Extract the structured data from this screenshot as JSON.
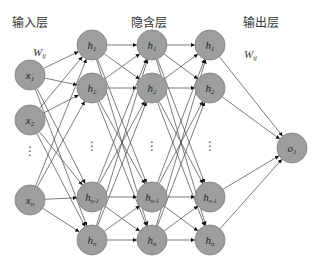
{
  "diagram": {
    "type": "neural-network",
    "labels": {
      "input_layer": "输入层",
      "hidden_layer": "隐含层",
      "output_layer": "输出层",
      "input_weight": "W",
      "input_weight_sub": "ij",
      "output_weight": "W",
      "output_weight_sub": "tj"
    },
    "colors": {
      "node_fill": "#9e9e9e",
      "edge": "#444444",
      "background": "#ffffff"
    },
    "input_nodes": [
      {
        "id": "x1",
        "base": "x",
        "sub": "1",
        "x": 30,
        "y": 75
      },
      {
        "id": "x2",
        "base": "x",
        "sub": "2",
        "x": 30,
        "y": 120
      },
      {
        "id": "xn",
        "base": "x",
        "sub": "n",
        "x": 30,
        "y": 200
      }
    ],
    "input_dots": {
      "x": 30,
      "y": 155
    },
    "hidden_columns": [
      {
        "x": 92,
        "nodes": [
          {
            "base": "h",
            "sub": "1",
            "y": 45
          },
          {
            "base": "h",
            "sub": "2",
            "y": 88
          },
          {
            "base": "h",
            "sub": "n-1",
            "y": 197
          },
          {
            "base": "h",
            "sub": "n",
            "y": 240
          }
        ],
        "dots_y": 150
      },
      {
        "x": 152,
        "nodes": [
          {
            "base": "h",
            "sub": "1",
            "y": 45
          },
          {
            "base": "h",
            "sub": "2",
            "y": 88
          },
          {
            "base": "h",
            "sub": "n-1",
            "y": 197
          },
          {
            "base": "h",
            "sub": "n",
            "y": 240
          }
        ],
        "dots_y": 150
      },
      {
        "x": 210,
        "nodes": [
          {
            "base": "h",
            "sub": "1",
            "y": 45
          },
          {
            "base": "h",
            "sub": "2",
            "y": 88
          },
          {
            "base": "h",
            "sub": "n-1",
            "y": 197
          },
          {
            "base": "h",
            "sub": "n",
            "y": 240
          }
        ],
        "dots_y": 150
      }
    ],
    "output_nodes": [
      {
        "id": "o1",
        "base": "o",
        "sub": "1",
        "x": 292,
        "y": 148
      }
    ]
  }
}
